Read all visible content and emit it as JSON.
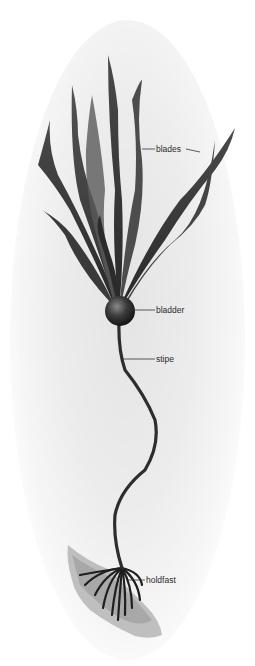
{
  "diagram": {
    "labels": [
      {
        "id": "blades",
        "text": "blades"
      },
      {
        "id": "bladder",
        "text": "bladder"
      },
      {
        "id": "stipe",
        "text": "stipe"
      },
      {
        "id": "holdfast",
        "text": "holdfast"
      }
    ],
    "colors": {
      "kelp": "#3a3a3a",
      "background": "#ffffff",
      "label_text": "#2a2a2a",
      "leader_line": "#333333"
    }
  }
}
